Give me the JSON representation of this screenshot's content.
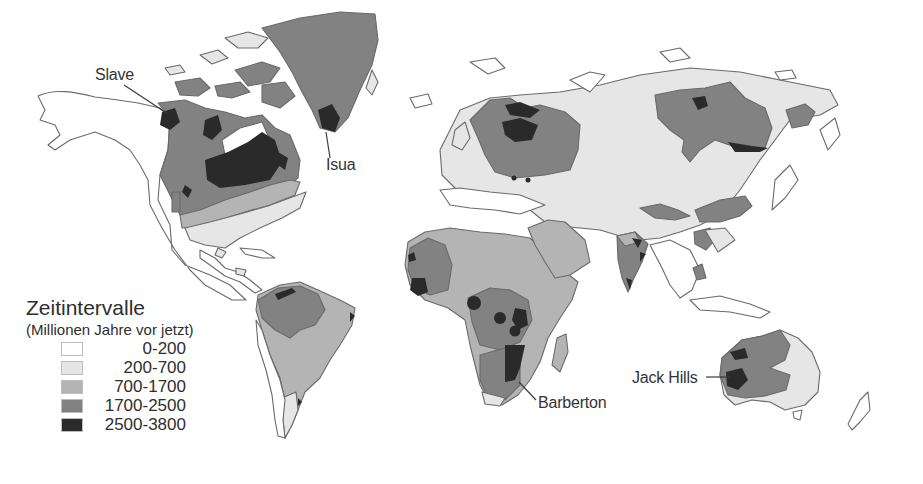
{
  "colors": {
    "c0": "#ffffff",
    "c1": "#e6e6e6",
    "c2": "#b4b4b4",
    "c3": "#828282",
    "c4": "#2a2a2a"
  },
  "labels": {
    "slave": "Slave",
    "isua": "Isua",
    "barberton": "Barberton",
    "jack_hills": "Jack Hills"
  },
  "legend": {
    "title": "Zeitintervalle",
    "subtitle": "(Millionen Jahre vor jetzt)",
    "items": [
      {
        "range": "0-200",
        "color": "#ffffff"
      },
      {
        "range": "200-700",
        "color": "#e6e6e6"
      },
      {
        "range": "700-1700",
        "color": "#b4b4b4"
      },
      {
        "range": "1700-2500",
        "color": "#828282"
      },
      {
        "range": "2500-3800",
        "color": "#2a2a2a"
      }
    ]
  }
}
